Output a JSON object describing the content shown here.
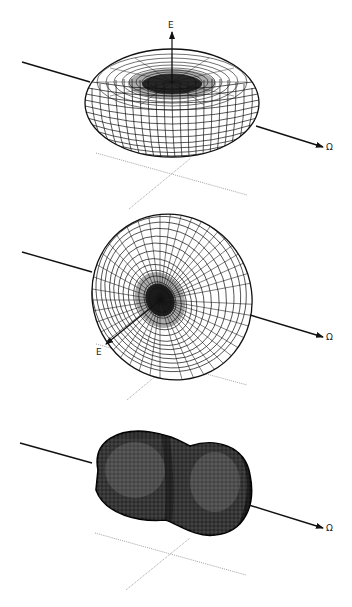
{
  "figure": {
    "panels": [
      {
        "id": "panel-1",
        "shape": "torus (oblate doughnut)",
        "axis_label": "Ω",
        "field_label": "E",
        "field_direction": "up (along vertical)"
      },
      {
        "id": "panel-2",
        "shape": "tilted ellipsoid with dimple",
        "axis_label": "Ω",
        "field_label": "E",
        "field_direction": "toward viewer (lower-left)"
      },
      {
        "id": "panel-3",
        "shape": "peanut (two-lobed)",
        "axis_label": "Ω"
      }
    ]
  },
  "colors": {
    "mesh": "#111111",
    "axis": "#111111",
    "ground_lines": "#9a9a9a",
    "background": "#ffffff"
  }
}
